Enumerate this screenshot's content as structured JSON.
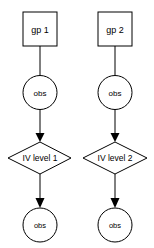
{
  "diagram": {
    "type": "flowchart",
    "columns": [
      {
        "nodes": [
          {
            "id": "gp1",
            "shape": "rectangle",
            "label": "gp 1"
          },
          {
            "id": "obs1a",
            "shape": "circle",
            "label": "obs"
          },
          {
            "id": "iv1",
            "shape": "diamond",
            "label": "IV level 1"
          },
          {
            "id": "obs1b",
            "shape": "circle",
            "label": "obs"
          }
        ],
        "edges": [
          {
            "from": "gp1",
            "to": "obs1a",
            "arrow": false
          },
          {
            "from": "obs1a",
            "to": "iv1",
            "arrow": true
          },
          {
            "from": "iv1",
            "to": "obs1b",
            "arrow": true
          }
        ]
      },
      {
        "nodes": [
          {
            "id": "gp2",
            "shape": "rectangle",
            "label": "gp 2"
          },
          {
            "id": "obs2a",
            "shape": "circle",
            "label": "obs"
          },
          {
            "id": "iv2",
            "shape": "diamond",
            "label": "IV level 2"
          },
          {
            "id": "obs2b",
            "shape": "circle",
            "label": "obs"
          }
        ],
        "edges": [
          {
            "from": "gp2",
            "to": "obs2a",
            "arrow": false
          },
          {
            "from": "obs2a",
            "to": "iv2",
            "arrow": true
          },
          {
            "from": "iv2",
            "to": "obs2b",
            "arrow": true
          }
        ]
      }
    ],
    "colors": {
      "stroke": "#000000",
      "fill": "#ffffff",
      "text": "#000000"
    }
  }
}
